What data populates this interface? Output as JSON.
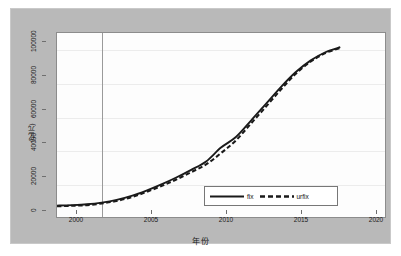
{
  "chart_data": {
    "type": "line",
    "title": "",
    "xlabel": "年份",
    "ylabel": "(亿元)",
    "xlim": [
      1998,
      2020
    ],
    "ylim": [
      0,
      110000
    ],
    "grid": true,
    "legend_position": "inside-lower-right",
    "xticks": [
      2000,
      2005,
      2010,
      2015,
      2020
    ],
    "xtick_labels": [
      "2000",
      "2005",
      "2010",
      "2015",
      "2020"
    ],
    "yticks": [
      0,
      20000,
      40000,
      60000,
      80000,
      100000
    ],
    "ytick_labels": [
      "0",
      "20000",
      "40000",
      "60000",
      "80000",
      "100000"
    ],
    "annotations": [
      {
        "type": "vline",
        "x": 2001,
        "label": ""
      }
    ],
    "x": [
      1998,
      1999,
      2000,
      2001,
      2002,
      2003,
      2004,
      2005,
      2006,
      2007,
      2008,
      2009,
      2010,
      2011,
      2012,
      2013,
      2014,
      2015,
      2016,
      2017
    ],
    "series": [
      {
        "name": "fix",
        "style": "solid",
        "color": "#1a1a1a",
        "values": [
          6800,
          7100,
          7600,
          8600,
          10200,
          12600,
          15800,
          19500,
          23600,
          28200,
          33200,
          41500,
          47800,
          57500,
          67500,
          77500,
          86500,
          93500,
          98500,
          101500
        ]
      },
      {
        "name": "urfix",
        "style": "dashed",
        "color": "#1a1a1a",
        "values": [
          6400,
          6700,
          7100,
          8100,
          9600,
          11900,
          15000,
          18500,
          22400,
          26800,
          31400,
          38200,
          45800,
          55800,
          65800,
          76000,
          85500,
          92800,
          98000,
          101000
        ]
      }
    ]
  },
  "legend": {
    "entries": [
      {
        "label": "fix",
        "swatch": "solid-line-swatch"
      },
      {
        "label": "urfix",
        "swatch": "dashed-line-swatch"
      }
    ]
  },
  "axes": {
    "y_title": "(亿元)",
    "x_title": "年份"
  }
}
